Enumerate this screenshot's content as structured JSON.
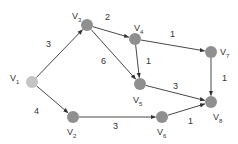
{
  "diagram": {
    "type": "directed-weighted-graph",
    "node_color": "#8f8f8f",
    "source_node_color": "#c4c4c4",
    "edge_color": "#333333",
    "nodes": [
      {
        "id": "V1",
        "base": "V",
        "sub": "1",
        "x": 32,
        "y": 82,
        "lx": 10,
        "ly": 74,
        "source": true
      },
      {
        "id": "V2",
        "base": "V",
        "sub": "2",
        "x": 73,
        "y": 117,
        "lx": 67,
        "ly": 128
      },
      {
        "id": "V3",
        "base": "V",
        "sub": "3",
        "x": 87,
        "y": 25,
        "lx": 72,
        "ly": 12
      },
      {
        "id": "V4",
        "base": "V",
        "sub": "4",
        "x": 135,
        "y": 39,
        "lx": 134,
        "ly": 24
      },
      {
        "id": "V5",
        "base": "V",
        "sub": "5",
        "x": 140,
        "y": 84,
        "lx": 133,
        "ly": 96
      },
      {
        "id": "V6",
        "base": "V",
        "sub": "6",
        "x": 162,
        "y": 117,
        "lx": 157,
        "ly": 128
      },
      {
        "id": "V7",
        "base": "V",
        "sub": "7",
        "x": 211,
        "y": 52,
        "lx": 220,
        "ly": 48
      },
      {
        "id": "V8",
        "base": "V",
        "sub": "8",
        "x": 211,
        "y": 102,
        "lx": 213,
        "ly": 113
      }
    ],
    "edges": [
      {
        "from": "V1",
        "to": "V3",
        "weight": "3",
        "wx": 46,
        "wy": 40
      },
      {
        "from": "V1",
        "to": "V2",
        "weight": "4",
        "wx": 34,
        "wy": 107
      },
      {
        "from": "V3",
        "to": "V4",
        "weight": "2",
        "wx": 105,
        "wy": 13
      },
      {
        "from": "V3",
        "to": "V5",
        "weight": "6",
        "wx": 101,
        "wy": 57
      },
      {
        "from": "V4",
        "to": "V5",
        "weight": "1",
        "wx": 146,
        "wy": 57
      },
      {
        "from": "V4",
        "to": "V7",
        "weight": "1",
        "wx": 170,
        "wy": 30
      },
      {
        "from": "V7",
        "to": "V8",
        "weight": "1",
        "wx": 222,
        "wy": 74
      },
      {
        "from": "V5",
        "to": "V8",
        "weight": "3",
        "wx": 173,
        "wy": 82
      },
      {
        "from": "V2",
        "to": "V6",
        "weight": "3",
        "wx": 113,
        "wy": 122
      },
      {
        "from": "V6",
        "to": "V8",
        "weight": "1",
        "wx": 188,
        "wy": 117
      }
    ]
  }
}
